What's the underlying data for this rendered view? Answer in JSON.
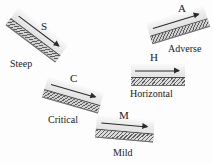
{
  "figure": {
    "title": "",
    "background_color": "#fdfdfd",
    "ink_color": "#1a1a1a",
    "bed_color": "#5e5e5e",
    "water_color": "#ededed"
  },
  "slopes": [
    {
      "key": "steep",
      "letter": "S",
      "name": "Steep",
      "angle_deg": 37,
      "direction": "descending",
      "flow_arrow": "right-arrow-icon"
    },
    {
      "key": "critical",
      "letter": "C",
      "name": "Critical",
      "angle_deg": 16,
      "direction": "descending",
      "flow_arrow": "right-arrow-icon"
    },
    {
      "key": "mild",
      "letter": "M",
      "name": "Mild",
      "angle_deg": 5,
      "direction": "descending",
      "flow_arrow": "right-arrow-icon"
    },
    {
      "key": "horizontal",
      "letter": "H",
      "name": "Horizontal",
      "angle_deg": 0,
      "direction": "level",
      "flow_arrow": "right-arrow-icon"
    },
    {
      "key": "adverse",
      "letter": "A",
      "name": "Adverse",
      "angle_deg": -17,
      "direction": "ascending",
      "flow_arrow": "right-arrow-icon"
    }
  ]
}
